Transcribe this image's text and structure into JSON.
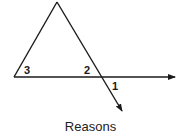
{
  "diagram": {
    "type": "geometry-figure",
    "points": {
      "apex": [
        57,
        2
      ],
      "left_vertex": [
        14,
        77
      ],
      "right_vertex": [
        101,
        77
      ],
      "ray_end_horizontal": [
        175,
        77
      ],
      "ray_end_transversal": [
        122,
        111
      ]
    },
    "angle_labels": [
      {
        "id": "3",
        "text": "3",
        "x": 24,
        "y": 73
      },
      {
        "id": "2",
        "text": "2",
        "x": 85,
        "y": 73
      },
      {
        "id": "1",
        "text": "1",
        "x": 112,
        "y": 90
      }
    ],
    "stroke_color": "#1a1a1a"
  },
  "caption": "Reasons"
}
